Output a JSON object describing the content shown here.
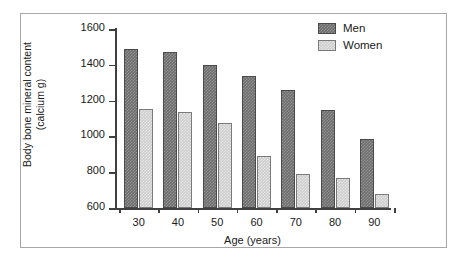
{
  "chart_data": {
    "type": "bar",
    "title": "",
    "xlabel": "Age (years)",
    "ylabel": "Body bone mineral content\n(calcium g)",
    "categories": [
      "30",
      "40",
      "50",
      "60",
      "70",
      "80",
      "90"
    ],
    "series": [
      {
        "name": "Men",
        "color": "#6e6e6e",
        "values": [
          1490,
          1470,
          1400,
          1335,
          1258,
          1148,
          985
        ]
      },
      {
        "name": "Women",
        "color": "#cdcdcd",
        "values": [
          1155,
          1135,
          1075,
          890,
          790,
          770,
          678
        ]
      }
    ],
    "ylim": [
      600,
      1600
    ],
    "yticks": [
      600,
      800,
      1000,
      1200,
      1400,
      1600
    ],
    "ytick_labels": [
      "600",
      "800",
      "1000",
      "1200",
      "1400",
      "1600"
    ],
    "grid": false,
    "legend_position": "top-right"
  },
  "legend": {
    "entries": [
      {
        "label": "Men"
      },
      {
        "label": "Women"
      }
    ]
  }
}
